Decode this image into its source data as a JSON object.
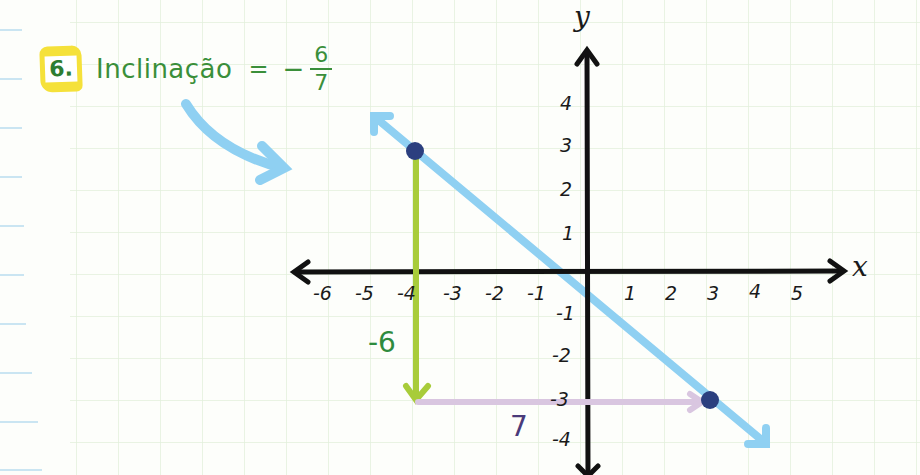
{
  "problem": {
    "number": "6.",
    "label": "Inclinação",
    "equals": "=",
    "sign": "−",
    "numerator": "6",
    "denominator": "7"
  },
  "axes": {
    "x_name": "x",
    "y_name": "y",
    "x_ticks": [
      "-6",
      "-5",
      "-4",
      "-3",
      "-2",
      "-1",
      "1",
      "2",
      "3",
      "4",
      "5"
    ],
    "y_ticks_pos": [
      "4",
      "3",
      "2",
      "1"
    ],
    "y_ticks_neg": [
      "-1",
      "-2",
      "-3",
      "-4"
    ]
  },
  "annotations": {
    "rise": "-6",
    "run": "7"
  },
  "colors": {
    "line": "#8fd0f2",
    "point": "#2b3f7f",
    "rise_arrow": "#a8cc3a",
    "run_arrow": "#d9c6e0",
    "rise_text": "#2e8b3e",
    "run_text": "#4a3a7a",
    "badge": "#f5e13a",
    "grid": "#e2efdc",
    "margin_lines": "#b8dcef"
  },
  "points": [
    {
      "name": "A",
      "x": -4,
      "y": 3
    },
    {
      "name": "B",
      "x": 3,
      "y": -3
    }
  ]
}
